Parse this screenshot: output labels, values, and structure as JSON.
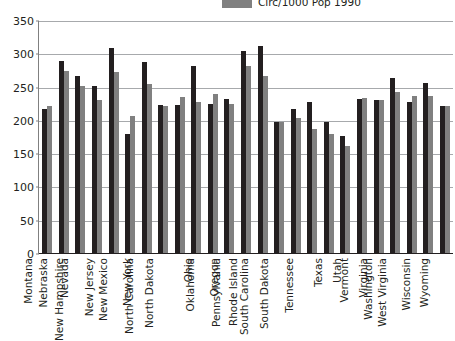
{
  "legend": {
    "position": "top-right",
    "entries": [
      {
        "label": "Circ/1000 Pop 1990",
        "color": "#808080",
        "swatch_icon": "legend-swatch-icon"
      }
    ]
  },
  "axes": {
    "y_ticks": [
      "0",
      "50",
      "100",
      "150",
      "200",
      "250",
      "300",
      "350"
    ],
    "y_min": 0,
    "y_max": 350,
    "y_step": 50
  },
  "colors": {
    "series_dark": "#231f20",
    "series_gray": "#808080",
    "gridline": "#a7a9ac",
    "axis": "#231f20",
    "background": "#ffffff"
  },
  "chart_data": {
    "type": "bar",
    "title": "",
    "subtitle": "",
    "xlabel": "",
    "ylabel": "",
    "ylim": [
      0,
      350
    ],
    "y_ticks": [
      0,
      50,
      100,
      150,
      200,
      250,
      300,
      350
    ],
    "grid": true,
    "legend_position": "top-right",
    "categories": [
      "Montana",
      "Nebraska",
      "Nevada",
      "New Hampshire",
      "New Jersey",
      "New Mexico",
      "New York",
      "North Carolina",
      "North Dakota",
      "Ohio",
      "Oklahoma",
      "Oregon",
      "Pennsylvania",
      "Rhode Island",
      "South Carolina",
      "South Dakota",
      "Tennessee",
      "Texas",
      "Utah",
      "Vermont",
      "Virginia",
      "Washington",
      "West Virginia",
      "Wisconsin",
      "Wyoming"
    ],
    "series": [
      {
        "name": "Series 1",
        "color": "#231f20",
        "values": [
          218,
          290,
          268,
          252,
          310,
          180,
          288,
          224,
          224,
          283,
          225,
          233,
          305,
          313,
          198,
          218,
          229,
          199,
          177,
          233,
          232,
          265,
          229,
          257,
          222
        ]
      },
      {
        "name": "Circ/1000 Pop 1990",
        "color": "#808080",
        "values": [
          223,
          275,
          252,
          232,
          274,
          208,
          255,
          222,
          236,
          229,
          240,
          225,
          282,
          268,
          198,
          204,
          188,
          180,
          163,
          235,
          232,
          243,
          238,
          238,
          223
        ]
      }
    ]
  }
}
